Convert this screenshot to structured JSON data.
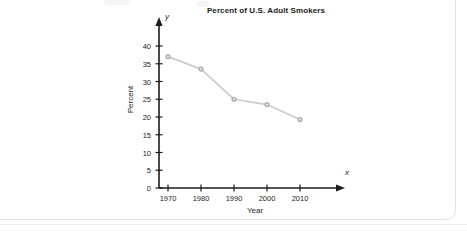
{
  "chart_data": {
    "type": "line",
    "title": "Percent of U.S. Adult Smokers",
    "xlabel": "Year",
    "ylabel": "Percent",
    "x_axis_letter": "y",
    "y_axis_letter": "x",
    "categories": [
      1970,
      1980,
      1990,
      2000,
      2010
    ],
    "x_tick_labels": [
      "1970",
      "1980",
      "1990",
      "2000",
      "2010"
    ],
    "y_tick_labels": [
      "0",
      "5",
      "10",
      "15",
      "20",
      "25",
      "30",
      "35",
      "40"
    ],
    "y_ticks": [
      0,
      5,
      10,
      15,
      20,
      25,
      30,
      35,
      40
    ],
    "values": [
      37,
      33.5,
      25,
      23.5,
      19.3
    ],
    "xlim": [
      1965,
      2018
    ],
    "ylim": [
      0,
      42
    ],
    "grid": false,
    "legend": false,
    "series_color": "#c9c9c9",
    "marker_color": "#b0b0b0",
    "axis_color": "#1c1c1c"
  },
  "axis_letters": {
    "vertical": "y",
    "horizontal": "x"
  }
}
